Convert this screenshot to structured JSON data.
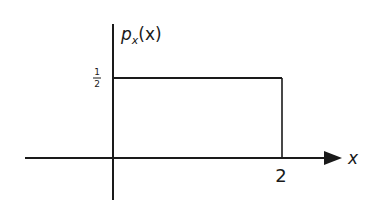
{
  "diagram": {
    "y_label": {
      "main": "p",
      "subscript": "x",
      "arg": "(x)"
    },
    "x_label": "x",
    "y_tick": {
      "num": "1",
      "den": "2"
    },
    "x_tick": "2",
    "density_height": 0.5,
    "support": [
      0,
      2
    ],
    "colors": {
      "line": "#1a1a1a",
      "background": "#ffffff"
    }
  }
}
